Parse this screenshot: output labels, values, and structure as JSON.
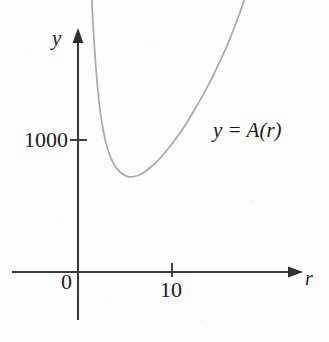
{
  "figure": {
    "background_color": "#fdfdfd",
    "axis_color": "#3a3a3a",
    "curve_color": "#a8a8a8",
    "text_color": "#1b1b1b"
  },
  "axes": {
    "y_axis_label": "y",
    "x_axis_label": "r",
    "y_tick_label": "1000",
    "x_tick_label": "10",
    "origin_label": "0"
  },
  "annotations": {
    "curve_label": "y = A(r)"
  },
  "chart_data": {
    "type": "line",
    "title": "",
    "xlabel": "r",
    "ylabel": "y",
    "grid": false,
    "legend": "none",
    "annotations": [
      {
        "text": "y = A(r)",
        "x": 15.5,
        "y": 1090
      }
    ],
    "xlim": [
      0,
      20.5
    ],
    "ylim": [
      0,
      2700
    ],
    "xticks": [
      0,
      10
    ],
    "xticklabels": [
      "0",
      "10"
    ],
    "yticks": [
      1000
    ],
    "yticklabels": [
      "1000"
    ],
    "series": [
      {
        "name": "A(r)",
        "comment": "Surface-area style cost curve: steep drop then gradual rise, minimum near r = 5.5",
        "x": [
          1.15,
          1.25,
          1.4,
          1.6,
          1.85,
          2.15,
          2.5,
          2.9,
          3.3,
          3.8,
          4.3,
          4.9,
          5.5,
          6.1,
          6.8,
          7.5,
          8.3,
          9.2,
          10.2,
          11.3,
          12.4,
          13.6,
          14.8,
          16.0,
          17.2,
          18.1
        ],
        "y": [
          2700,
          2480,
          2180,
          1880,
          1600,
          1350,
          1150,
          1000,
          900,
          820,
          770,
          735,
          720,
          725,
          745,
          780,
          830,
          900,
          990,
          1100,
          1230,
          1380,
          1550,
          1740,
          1960,
          2150
        ]
      }
    ]
  }
}
